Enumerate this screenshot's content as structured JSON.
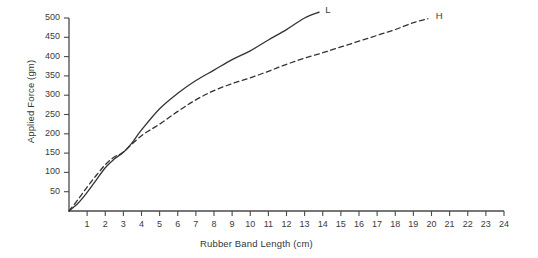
{
  "chart_data": {
    "type": "line",
    "title": "",
    "xlabel": "Rubber Band Length (cm)",
    "ylabel": "Applied Force (gm)",
    "xlim": [
      0,
      24
    ],
    "ylim": [
      0,
      500
    ],
    "xticks": [
      1,
      2,
      3,
      4,
      5,
      6,
      7,
      8,
      9,
      10,
      11,
      12,
      13,
      14,
      15,
      16,
      17,
      18,
      19,
      20,
      21,
      22,
      23,
      24
    ],
    "yticks": [
      50,
      100,
      150,
      200,
      250,
      300,
      350,
      400,
      450,
      500
    ],
    "grid": false,
    "legend_position": "line-end-labels",
    "series": [
      {
        "name": "L",
        "label": "L",
        "style": "solid",
        "color": "#333333",
        "x": [
          0,
          0.5,
          1,
          1.5,
          2,
          2.5,
          3,
          3.5,
          4,
          5,
          6,
          7,
          8,
          9,
          10,
          11,
          12,
          13,
          13.8
        ],
        "y": [
          0,
          20,
          48,
          80,
          112,
          135,
          152,
          178,
          210,
          265,
          305,
          338,
          365,
          392,
          415,
          443,
          470,
          500,
          515
        ]
      },
      {
        "name": "H",
        "label": "H",
        "style": "dashed",
        "color": "#333333",
        "x": [
          0,
          0.5,
          1,
          1.5,
          2,
          2.5,
          3,
          4,
          5,
          6,
          7,
          8,
          9,
          10,
          11,
          12,
          13,
          14,
          15,
          16,
          17,
          18,
          19,
          19.8
        ],
        "y": [
          0,
          30,
          62,
          92,
          120,
          140,
          153,
          195,
          225,
          258,
          288,
          312,
          330,
          345,
          362,
          380,
          396,
          410,
          425,
          440,
          455,
          470,
          488,
          498
        ]
      }
    ],
    "annotations": [
      {
        "text": "L",
        "x": 14.3,
        "y": 522
      },
      {
        "text": "H",
        "x": 20.4,
        "y": 505
      }
    ]
  }
}
